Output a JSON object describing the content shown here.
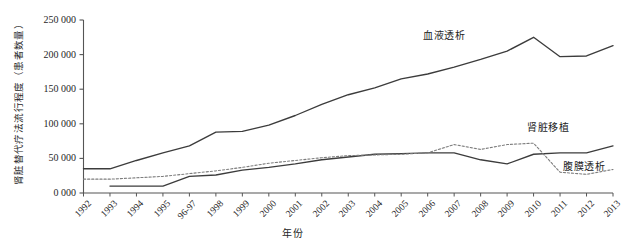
{
  "chart_data": {
    "type": "line",
    "title": "",
    "xlabel": "年份",
    "ylabel": "肾脏替代疗法流行程度（患者数量）",
    "categories": [
      "1992",
      "1993",
      "1994",
      "1995",
      "96-97",
      "1998",
      "1999",
      "2000",
      "2001",
      "2002",
      "2003",
      "2004",
      "2005",
      "2006",
      "2007",
      "2008",
      "2009",
      "2010",
      "2011",
      "2012",
      "2013"
    ],
    "ylim": [
      0,
      250000
    ],
    "yticks": [
      0,
      50000,
      100000,
      150000,
      200000,
      250000
    ],
    "ytick_labels": [
      "0 000",
      "50 000",
      "100 000",
      "150 000",
      "200 000",
      "250 000"
    ],
    "grid": false,
    "legend_position": "inline-annotations",
    "series": [
      {
        "name": "血液透析",
        "style": "solid",
        "color": "#3c3c3c",
        "values": [
          35000,
          35000,
          47000,
          58000,
          68000,
          88000,
          89000,
          98000,
          112000,
          128000,
          142000,
          152000,
          165000,
          172000,
          182000,
          193000,
          205000,
          225000,
          197000,
          198000,
          213000
        ]
      },
      {
        "name": "肾脏移植",
        "style": "solid",
        "color": "#3c3c3c",
        "values": [
          null,
          10000,
          10000,
          10000,
          24000,
          26000,
          33000,
          37000,
          42000,
          48000,
          52000,
          56000,
          57000,
          58000,
          58000,
          48000,
          42000,
          56000,
          58000,
          58000,
          68000
        ]
      },
      {
        "name": "腹膜透析",
        "style": "dashed",
        "color": "#7d7d7d",
        "values": [
          20000,
          20000,
          22000,
          24000,
          28000,
          32000,
          37000,
          43000,
          47000,
          51000,
          54000,
          55000,
          56000,
          58000,
          70000,
          63000,
          70000,
          72000,
          30000,
          27000,
          34000
        ]
      }
    ]
  },
  "axis": {
    "y_title": "肾脏替代疗法流行程度（患者数量）",
    "x_title": "年份"
  },
  "annotations": {
    "hemodialysis_label": "血液透析",
    "transplant_label": "肾脏移植",
    "peritoneal_label": "腹膜透析"
  }
}
